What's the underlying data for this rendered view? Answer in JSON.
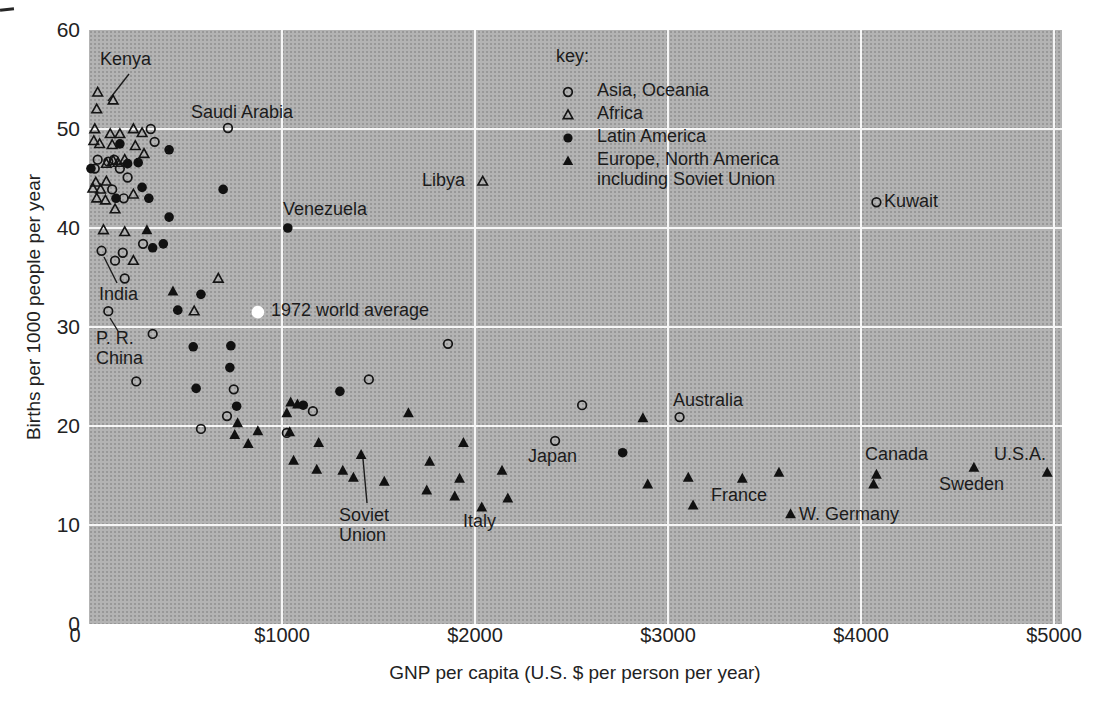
{
  "figure": {
    "bg": "#ffffff",
    "plot_bg": "#b3b3b3",
    "grid_color": "#f6f6f6",
    "ink": "#141414"
  },
  "axes": {
    "x": {
      "title": "GNP per capita (U.S. $ per person per year)",
      "ticks": [
        {
          "v": 0,
          "label": "0",
          "dx": -14
        },
        {
          "v": 1000,
          "label": "$1000",
          "dx": 0
        },
        {
          "v": 2000,
          "label": "$2000",
          "dx": 0
        },
        {
          "v": 3000,
          "label": "$3000",
          "dx": 0
        },
        {
          "v": 4000,
          "label": "$4000",
          "dx": 0
        },
        {
          "v": 5000,
          "label": "$5000",
          "dx": 0
        }
      ]
    },
    "y": {
      "title": "Births per 1000 people per year",
      "ticks": [
        {
          "v": 60,
          "label": "60"
        },
        {
          "v": 50,
          "label": "50"
        },
        {
          "v": 40,
          "label": "40"
        },
        {
          "v": 30,
          "label": "30"
        },
        {
          "v": 20,
          "label": "20"
        },
        {
          "v": 10,
          "label": "10"
        },
        {
          "v": 0,
          "label": "0"
        }
      ]
    },
    "gridlines": {
      "x": [
        1000,
        2000,
        3000,
        4000,
        5000
      ],
      "y": [
        10,
        20,
        30,
        40,
        50
      ]
    }
  },
  "key": {
    "title": "key:",
    "entries": [
      {
        "marker": "open-circle",
        "label": "Asia, Oceania"
      },
      {
        "marker": "open-triangle",
        "label": "Africa"
      },
      {
        "marker": "filled-circle",
        "label": "Latin America"
      },
      {
        "marker": "filled-triangle",
        "label": "Europe, North America\nincluding Soviet Union"
      }
    ]
  },
  "chart_data": {
    "type": "scatter",
    "title": "",
    "xlabel": "GNP per capita (U.S. $ per person per year)",
    "ylabel": "Births per 1000 people per year",
    "xlim": [
      0,
      5000
    ],
    "ylim": [
      0,
      60
    ],
    "grid": true,
    "series": [
      {
        "name": "Asia, Oceania",
        "marker": "open-circle",
        "points": [
          [
            320,
            50.0
          ],
          [
            720,
            50.1
          ],
          [
            340,
            48.7
          ],
          [
            45,
            46.9
          ],
          [
            100,
            46.7
          ],
          [
            130,
            46.9
          ],
          [
            30,
            46.0
          ],
          [
            160,
            46.0
          ],
          [
            200,
            45.1
          ],
          [
            120,
            43.9
          ],
          [
            180,
            43.0
          ],
          [
            65,
            37.7
          ],
          [
            175,
            37.5
          ],
          [
            135,
            36.7
          ],
          [
            280,
            38.4
          ],
          [
            185,
            34.9
          ],
          [
            100,
            31.6
          ],
          [
            330,
            29.3
          ],
          [
            245,
            24.5
          ],
          [
            750,
            23.7
          ],
          [
            1860,
            28.3
          ],
          [
            1450,
            24.7
          ],
          [
            580,
            19.7
          ],
          [
            715,
            21.0
          ],
          [
            1025,
            19.3
          ],
          [
            1160,
            21.5
          ],
          [
            2555,
            22.1
          ],
          [
            2415,
            18.5
          ],
          [
            3060,
            20.9
          ],
          [
            4080,
            42.6
          ]
        ]
      },
      {
        "name": "Africa",
        "marker": "open-triangle",
        "points": [
          [
            45,
            53.7
          ],
          [
            125,
            52.9
          ],
          [
            40,
            52.0
          ],
          [
            30,
            50.0
          ],
          [
            110,
            49.5
          ],
          [
            160,
            49.5
          ],
          [
            230,
            50.0
          ],
          [
            275,
            49.6
          ],
          [
            25,
            48.8
          ],
          [
            55,
            48.5
          ],
          [
            120,
            48.4
          ],
          [
            240,
            48.3
          ],
          [
            285,
            47.5
          ],
          [
            125,
            46.8
          ],
          [
            185,
            46.9
          ],
          [
            90,
            46.5
          ],
          [
            150,
            46.6
          ],
          [
            35,
            44.6
          ],
          [
            90,
            44.7
          ],
          [
            20,
            44.0
          ],
          [
            60,
            43.9
          ],
          [
            40,
            43.0
          ],
          [
            85,
            42.8
          ],
          [
            230,
            43.4
          ],
          [
            135,
            41.9
          ],
          [
            75,
            39.8
          ],
          [
            185,
            39.6
          ],
          [
            230,
            36.7
          ],
          [
            545,
            31.6
          ],
          [
            670,
            34.9
          ],
          [
            2040,
            44.7
          ]
        ]
      },
      {
        "name": "Latin America",
        "marker": "filled-circle",
        "points": [
          [
            160,
            48.5
          ],
          [
            415,
            47.9
          ],
          [
            200,
            46.5
          ],
          [
            255,
            46.6
          ],
          [
            10,
            46.0
          ],
          [
            275,
            44.1
          ],
          [
            140,
            43.0
          ],
          [
            310,
            43.0
          ],
          [
            695,
            43.9
          ],
          [
            415,
            41.1
          ],
          [
            330,
            38.0
          ],
          [
            385,
            38.4
          ],
          [
            1030,
            40.0
          ],
          [
            580,
            33.3
          ],
          [
            460,
            31.7
          ],
          [
            540,
            28.0
          ],
          [
            735,
            28.1
          ],
          [
            730,
            25.9
          ],
          [
            555,
            23.8
          ],
          [
            765,
            22.0
          ],
          [
            1110,
            22.1
          ],
          [
            1300,
            23.5
          ],
          [
            2765,
            17.3
          ]
        ]
      },
      {
        "name": "Europe, North America including Soviet Union",
        "marker": "filled-triangle",
        "points": [
          [
            300,
            39.8
          ],
          [
            435,
            33.6
          ],
          [
            770,
            20.3
          ],
          [
            755,
            19.1
          ],
          [
            825,
            18.2
          ],
          [
            875,
            19.5
          ],
          [
            1040,
            19.4
          ],
          [
            1045,
            22.4
          ],
          [
            1080,
            22.2
          ],
          [
            1025,
            21.3
          ],
          [
            1060,
            16.5
          ],
          [
            1190,
            18.3
          ],
          [
            1180,
            15.6
          ],
          [
            1315,
            15.5
          ],
          [
            1370,
            14.8
          ],
          [
            1410,
            17.1
          ],
          [
            1530,
            14.4
          ],
          [
            1655,
            21.3
          ],
          [
            1765,
            16.4
          ],
          [
            1750,
            13.5
          ],
          [
            1895,
            12.9
          ],
          [
            1940,
            18.3
          ],
          [
            1920,
            14.7
          ],
          [
            2035,
            11.8
          ],
          [
            2140,
            15.5
          ],
          [
            2170,
            12.7
          ],
          [
            2870,
            20.8
          ],
          [
            2895,
            14.1
          ],
          [
            3105,
            14.8
          ],
          [
            3130,
            12.0
          ],
          [
            3385,
            14.7
          ],
          [
            3575,
            15.3
          ],
          [
            3635,
            11.1
          ],
          [
            4080,
            15.1
          ],
          [
            4065,
            14.1
          ],
          [
            4585,
            15.8
          ],
          [
            4965,
            15.3
          ]
        ]
      },
      {
        "name": "1972 world average",
        "marker": "white-circle",
        "points": [
          [
            875,
            31.5
          ]
        ]
      }
    ],
    "annotations": [
      {
        "text": "Kenya",
        "x": 100,
        "y": 49,
        "leader": [
          129,
          74,
          108,
          101
        ]
      },
      {
        "text": "Saudi Arabia",
        "x": 191,
        "y": 102
      },
      {
        "text": "Libya",
        "x": 422,
        "y": 170
      },
      {
        "text": "Venezuela",
        "x": 283,
        "y": 199
      },
      {
        "text": "1972 world average",
        "x": 271,
        "y": 300
      },
      {
        "text": "India",
        "x": 99,
        "y": 284,
        "leader": [
          104,
          257,
          117,
          283
        ]
      },
      {
        "text": "P. R.\nChina",
        "x": 96,
        "y": 328,
        "leader": [
          110,
          318,
          118,
          331
        ]
      },
      {
        "text": "Soviet\nUnion",
        "x": 339,
        "y": 505,
        "leader": [
          363,
          459,
          367,
          503
        ]
      },
      {
        "text": "Italy",
        "x": 463,
        "y": 511
      },
      {
        "text": "Japan",
        "x": 528,
        "y": 446
      },
      {
        "text": "Australia",
        "x": 673,
        "y": 390
      },
      {
        "text": "France",
        "x": 711,
        "y": 485
      },
      {
        "text": "W. Germany",
        "x": 799,
        "y": 504
      },
      {
        "text": "Canada",
        "x": 865,
        "y": 444
      },
      {
        "text": "Sweden",
        "x": 939,
        "y": 474
      },
      {
        "text": "U.S.A.",
        "x": 994,
        "y": 444
      },
      {
        "text": "Kuwait",
        "x": 884,
        "y": 191
      }
    ]
  }
}
